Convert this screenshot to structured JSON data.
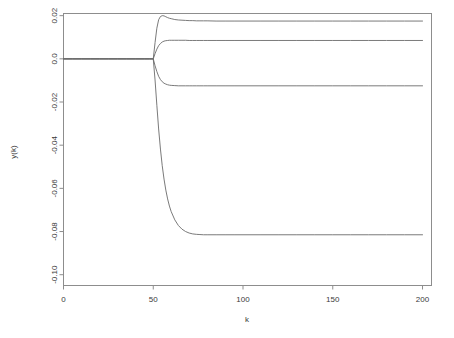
{
  "chart_data": {
    "type": "line",
    "title": "",
    "subtitle": "",
    "xlabel": "k",
    "ylabel": "y(k)",
    "xlim": [
      0,
      205
    ],
    "ylim": [
      -0.105,
      0.021
    ],
    "grid": false,
    "legend": null,
    "x_ticks": [
      0,
      50,
      100,
      150,
      200
    ],
    "x_tick_labels": [
      "0",
      "50",
      "100",
      "150",
      "200"
    ],
    "y_ticks": [
      0.02,
      0.0,
      -0.02,
      -0.04,
      -0.06,
      -0.08,
      -0.1
    ],
    "y_tick_labels": [
      "0.02",
      "0.0",
      "-0.02",
      "-0.04",
      "-0.06",
      "-0.08",
      "-0.10"
    ],
    "x": [
      0,
      5,
      10,
      15,
      20,
      25,
      30,
      35,
      40,
      45,
      48,
      50,
      51,
      52,
      53,
      54,
      55,
      56,
      57,
      58,
      59,
      60,
      62,
      64,
      66,
      68,
      70,
      72,
      74,
      76,
      78,
      80,
      85,
      90,
      95,
      100,
      110,
      120,
      130,
      140,
      150,
      160,
      170,
      180,
      190,
      200
    ],
    "series": [
      {
        "name": "curve-1",
        "steady_state": 0.0175,
        "values": [
          0.0,
          0.0,
          0.0,
          0.0,
          0.0,
          0.0,
          0.0,
          0.0,
          0.0,
          0.0,
          0.0,
          0.0,
          0.0075,
          0.0142,
          0.0181,
          0.0196,
          0.02,
          0.0199,
          0.0195,
          0.0191,
          0.0188,
          0.0186,
          0.0182,
          0.018,
          0.0179,
          0.0178,
          0.0177,
          0.0177,
          0.0176,
          0.0176,
          0.0176,
          0.0176,
          0.0175,
          0.0175,
          0.0175,
          0.0175,
          0.0175,
          0.0175,
          0.0175,
          0.0175,
          0.0175,
          0.0175,
          0.0175,
          0.0175,
          0.0175,
          0.0175
        ]
      },
      {
        "name": "curve-2",
        "steady_state": 0.0085,
        "values": [
          0.0,
          0.0,
          0.0,
          0.0,
          0.0,
          0.0,
          0.0,
          0.0,
          0.0,
          0.0,
          0.0,
          0.0,
          0.0024,
          0.0045,
          0.0061,
          0.0071,
          0.0078,
          0.0082,
          0.0084,
          0.0085,
          0.0086,
          0.0086,
          0.0086,
          0.0086,
          0.0086,
          0.0086,
          0.0085,
          0.0085,
          0.0085,
          0.0085,
          0.0085,
          0.0085,
          0.0085,
          0.0085,
          0.0085,
          0.0085,
          0.0085,
          0.0085,
          0.0085,
          0.0085,
          0.0085,
          0.0085,
          0.0085,
          0.0085,
          0.0085,
          0.0085
        ]
      },
      {
        "name": "curve-3",
        "steady_state": -0.0125,
        "values": [
          0.0,
          0.0,
          0.0,
          0.0,
          0.0,
          0.0,
          0.0,
          0.0,
          0.0,
          0.0,
          0.0,
          0.0,
          -0.0032,
          -0.0059,
          -0.0081,
          -0.0096,
          -0.0106,
          -0.0113,
          -0.0117,
          -0.012,
          -0.0122,
          -0.0123,
          -0.0124,
          -0.0125,
          -0.0125,
          -0.0125,
          -0.0125,
          -0.0125,
          -0.0125,
          -0.0125,
          -0.0125,
          -0.0125,
          -0.0125,
          -0.0125,
          -0.0125,
          -0.0125,
          -0.0125,
          -0.0125,
          -0.0125,
          -0.0125,
          -0.0125,
          -0.0125,
          -0.0125,
          -0.0125,
          -0.0125,
          -0.0125
        ]
      },
      {
        "name": "curve-4",
        "steady_state": -0.0815,
        "values": [
          0.0,
          0.0,
          0.0,
          0.0,
          0.0,
          0.0,
          0.0,
          0.0,
          0.0,
          0.0,
          0.0,
          0.0,
          -0.0098,
          -0.0215,
          -0.0325,
          -0.0418,
          -0.0495,
          -0.0557,
          -0.0608,
          -0.0649,
          -0.0682,
          -0.0708,
          -0.0746,
          -0.0772,
          -0.0789,
          -0.08,
          -0.0807,
          -0.0811,
          -0.0813,
          -0.0814,
          -0.0815,
          -0.0815,
          -0.0815,
          -0.0815,
          -0.0815,
          -0.0815,
          -0.0815,
          -0.0815,
          -0.0815,
          -0.0815,
          -0.0815,
          -0.0815,
          -0.0815,
          -0.0815,
          -0.0815,
          -0.0815
        ]
      }
    ]
  }
}
